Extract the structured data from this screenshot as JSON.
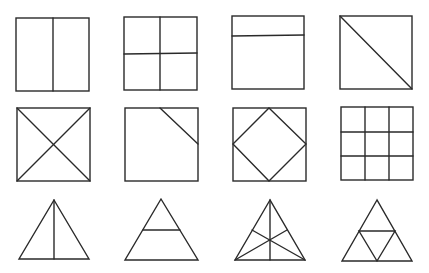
{
  "diagram": {
    "line_color": "#2a2a2a",
    "background": "#ffffff",
    "shapes": [
      {
        "id": "sq-halves-vertical",
        "row": 1,
        "col": 1,
        "type": "square",
        "division": "one vertical line through center"
      },
      {
        "id": "sq-quarters-grid",
        "row": 1,
        "col": 2,
        "type": "square",
        "division": "vertical and horizontal center lines"
      },
      {
        "id": "sq-top-strip",
        "row": 1,
        "col": 3,
        "type": "square",
        "division": "horizontal line near top"
      },
      {
        "id": "sq-diagonal",
        "row": 1,
        "col": 4,
        "type": "square",
        "division": "diagonal top-left to bottom-right"
      },
      {
        "id": "sq-both-diagonals",
        "row": 2,
        "col": 1,
        "type": "square",
        "division": "both diagonals"
      },
      {
        "id": "sq-corner-cut",
        "row": 2,
        "col": 2,
        "type": "square",
        "division": "line cutting top-right corner"
      },
      {
        "id": "sq-inscribed-diamond",
        "row": 2,
        "col": 3,
        "type": "square",
        "division": "diamond joining edge midpoints"
      },
      {
        "id": "sq-ninths-grid",
        "row": 2,
        "col": 4,
        "type": "square",
        "division": "3x3 grid"
      },
      {
        "id": "tri-median",
        "row": 3,
        "col": 1,
        "type": "triangle",
        "division": "vertical line from apex to base"
      },
      {
        "id": "tri-horizontal-cut",
        "row": 3,
        "col": 2,
        "type": "triangle",
        "division": "horizontal line at mid-height"
      },
      {
        "id": "tri-three-medians",
        "row": 3,
        "col": 3,
        "type": "triangle",
        "division": "three medians meeting at centroid"
      },
      {
        "id": "tri-four-subtriangles",
        "row": 3,
        "col": 4,
        "type": "triangle",
        "division": "midpoint triangle forming four parts"
      }
    ]
  }
}
